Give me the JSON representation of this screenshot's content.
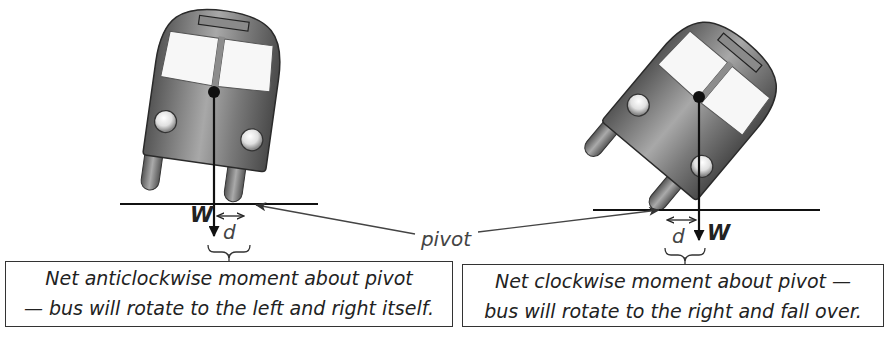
{
  "diagram": {
    "labels": {
      "weight_symbol": "W",
      "distance_symbol": "d",
      "pivot": "pivot"
    },
    "left_case": {
      "caption_line1": "Net anticlockwise moment about pivot",
      "caption_line2": "— bus will rotate to the left and right itself."
    },
    "right_case": {
      "caption_line1": "Net clockwise moment about pivot —",
      "caption_line2": "bus will rotate to the right and fall over."
    },
    "colors": {
      "bus_body": "#6e6e6e",
      "bus_body_light": "#bdbdbd",
      "window": "#f7f7f7",
      "line": "#1a1a1a",
      "pointer": "#444444"
    }
  }
}
